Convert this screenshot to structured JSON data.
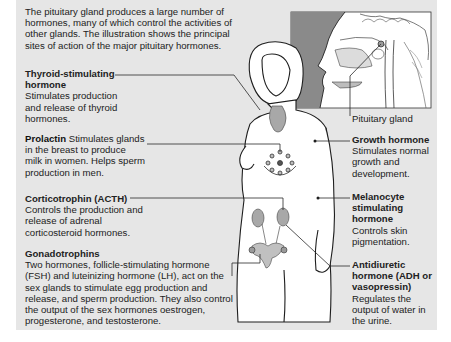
{
  "intro": "The pituitary gland produces a large number of hormones, many of which control the activities of other glands. The illustration shows the principal sites of action of the major pituitary hormones.",
  "inset": {
    "label": "Pituitary gland"
  },
  "hormones": [
    {
      "id": "tsh",
      "name": "Thyroid-stimulating hormone",
      "name_line1": "Thyroid-stimulating",
      "name_line2": "hormone",
      "description": "Stimulates production and release of thyroid hormones.",
      "side": "left",
      "target": "thyroid"
    },
    {
      "id": "prolactin",
      "name": "Prolactin",
      "description": "Stimulates glands in the breast to produce milk in women. Helps sperm production in men.",
      "side": "left",
      "target": "breast"
    },
    {
      "id": "acth",
      "name": "Corticotrophin (ACTH)",
      "description": "Controls the production and release of adrenal corticosteroid hormones.",
      "side": "left",
      "target": "adrenal glands"
    },
    {
      "id": "gonadotrophins",
      "name": "Gonadotrophins",
      "description": "Two hormones, follicle-stimulating hormone (FSH) and luteinizing hormone (LH), act on the sex glands to stimulate egg production and release, and sperm production. They also control the output of the sex hormones oestrogen, progesterone, and testosterone.",
      "side": "left",
      "target": "ovaries"
    },
    {
      "id": "gh",
      "name": "Growth hormone",
      "description": "Stimulates normal growth and development.",
      "side": "right",
      "target": "body"
    },
    {
      "id": "msh",
      "name": "Melanocyte stimulating hormone",
      "description": "Controls skin pigmentation.",
      "side": "right",
      "target": "skin"
    },
    {
      "id": "adh",
      "name": "Antidiuretic hormone (ADH or vasopressin)",
      "description": "Regulates the output of water in the urine.",
      "side": "right",
      "target": "kidneys"
    }
  ],
  "colors": {
    "panel": "#e6e6e6",
    "line": "#2a2a2a",
    "inset_bg": "#8a8a8a",
    "organ": "#a8a8a8"
  }
}
